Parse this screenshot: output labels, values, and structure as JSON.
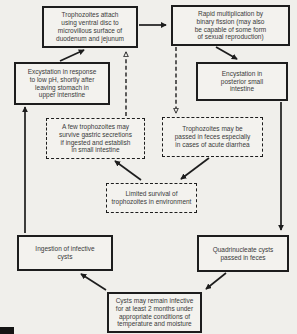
{
  "diagram": {
    "colors": {
      "background": "#f0efeb",
      "box_border": "#1d1d1d",
      "text": "#3a3a3a"
    },
    "nodes": [
      {
        "id": "trophozoites-attach",
        "style": "solid",
        "text": "Trophozoites attach\nusing ventral disc to\nmicrovillous surface of\nduodenum and jejunum"
      },
      {
        "id": "rapid-multiplication",
        "style": "solid",
        "text": "Rapid multiplication by\nbinary fission (may also\nbe capable of some form\nof sexual reproduction)"
      },
      {
        "id": "excystation",
        "style": "solid",
        "text": "Excystation in response\nto low pH, shortly after\nleaving stomach in\nupper intenstine"
      },
      {
        "id": "encystation",
        "style": "solid",
        "text": "Encystation in\nposterior small\nintestine"
      },
      {
        "id": "few-trophozoites-survive",
        "style": "dashed",
        "text": "A few trophozoites may\nsurvive gastric secretions\nif ingested and establish\nin small intestine"
      },
      {
        "id": "trophozoites-passed-feces",
        "style": "dashed",
        "text": "Trophozoites may be\npassed in feces especially\nin cases of acute diarrhea"
      },
      {
        "id": "limited-survival",
        "style": "dashed",
        "text": "Limited survival of\ntrophozoites in environment"
      },
      {
        "id": "ingestion-infective-cysts",
        "style": "solid",
        "text": "Ingestion of infective\ncysts"
      },
      {
        "id": "quadrinucleate-cysts",
        "style": "solid",
        "text": "Quadrinucleate cysts\npassed in feces"
      },
      {
        "id": "cysts-remain-infective",
        "style": "solid",
        "text": "Cysts may remain infective\nfor at least 2 months under\nappropriate conditions of\ntemperature and moisture"
      }
    ],
    "edges": [
      {
        "from": "trophozoites-attach",
        "to": "rapid-multiplication",
        "style": "solid"
      },
      {
        "from": "excystation",
        "to": "trophozoites-attach",
        "style": "solid"
      },
      {
        "from": "rapid-multiplication",
        "to": "encystation",
        "style": "solid"
      },
      {
        "from": "few-trophozoites-survive",
        "to": "trophozoites-attach",
        "style": "dashed"
      },
      {
        "from": "rapid-multiplication",
        "to": "trophozoites-passed-feces",
        "style": "dashed"
      },
      {
        "from": "encystation",
        "to": "quadrinucleate-cysts",
        "style": "solid"
      },
      {
        "from": "trophozoites-passed-feces",
        "to": "limited-survival",
        "style": "solid"
      },
      {
        "from": "limited-survival",
        "to": "few-trophozoites-survive",
        "style": "solid"
      },
      {
        "from": "quadrinucleate-cysts",
        "to": "cysts-remain-infective",
        "style": "solid"
      },
      {
        "from": "cysts-remain-infective",
        "to": "ingestion-infective-cysts",
        "style": "solid"
      },
      {
        "from": "ingestion-infective-cysts",
        "to": "excystation",
        "style": "solid"
      }
    ]
  }
}
